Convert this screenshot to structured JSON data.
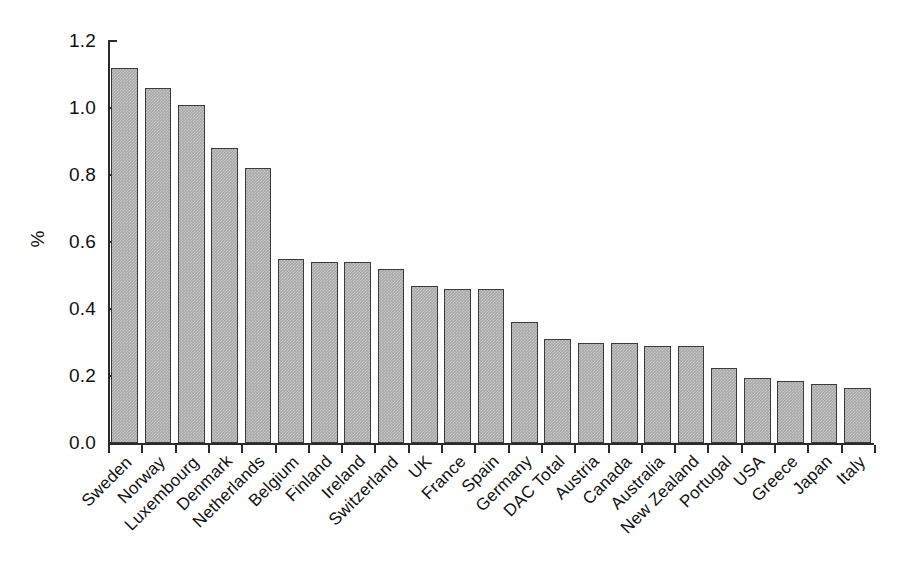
{
  "chart_data": {
    "type": "bar",
    "title": "",
    "subtitle": "",
    "xlabel": "",
    "ylabel": "%",
    "ylim": [
      0.0,
      1.2
    ],
    "yticks": [
      "0.0",
      "0.2",
      "0.4",
      "0.6",
      "0.8",
      "1.0",
      "1.2"
    ],
    "ytick_values": [
      0.0,
      0.2,
      0.4,
      0.6,
      0.8,
      1.0,
      1.2
    ],
    "grid": false,
    "legend": false,
    "orientation": "vertical",
    "bar_color": "#a9a9a9",
    "bar_edge_color": "#3a3a3a",
    "axis_color": "#2b2b2b",
    "categories": [
      "Sweden",
      "Norway",
      "Luxembourg",
      "Denmark",
      "Netherlands",
      "Belgium",
      "Finland",
      "Ireland",
      "Switzerland",
      "UK",
      "France",
      "Spain",
      "Germany",
      "DAC Total",
      "Austria",
      "Canada",
      "Australia",
      "New Zealand",
      "Portugal",
      "USA",
      "Greece",
      "Japan",
      "Italy"
    ],
    "values": [
      1.12,
      1.06,
      1.01,
      0.88,
      0.82,
      0.55,
      0.54,
      0.54,
      0.52,
      0.47,
      0.46,
      0.46,
      0.36,
      0.31,
      0.3,
      0.3,
      0.29,
      0.29,
      0.225,
      0.195,
      0.185,
      0.175,
      0.165
    ]
  }
}
